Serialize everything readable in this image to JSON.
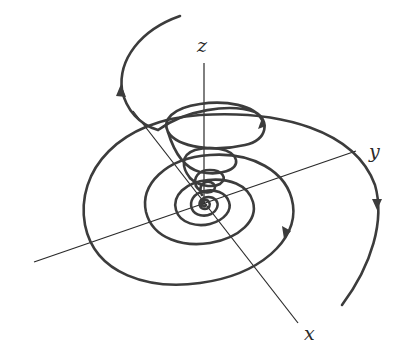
{
  "figure": {
    "axes": {
      "x": {
        "label": "x"
      },
      "y": {
        "label": "y"
      },
      "z": {
        "label": "z"
      }
    },
    "colors": {
      "axis": "#2a2a2a",
      "curve": "#3c3c3c",
      "background": "#ffffff"
    },
    "arrows": 4
  }
}
